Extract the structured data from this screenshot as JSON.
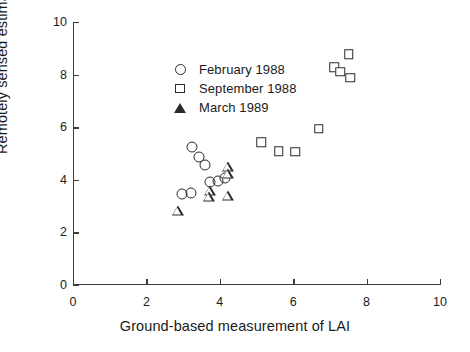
{
  "chart_data": {
    "type": "scatter",
    "title": "",
    "xlabel": "Ground-based measurement of LAI",
    "ylabel": "Remotely sensed estimate of LAI",
    "xlim": [
      0,
      10
    ],
    "ylim": [
      0,
      10
    ],
    "xticks": [
      0,
      2,
      4,
      6,
      8,
      10
    ],
    "yticks": [
      0,
      2,
      4,
      6,
      8,
      10
    ],
    "grid": false,
    "legend_position": "upper-left-inside",
    "series": [
      {
        "name": "February 1988",
        "marker": "circle",
        "points": [
          {
            "x": 3.25,
            "y": 5.25
          },
          {
            "x": 3.42,
            "y": 4.85
          },
          {
            "x": 3.6,
            "y": 4.57
          },
          {
            "x": 2.97,
            "y": 3.45
          },
          {
            "x": 3.22,
            "y": 3.5
          },
          {
            "x": 3.72,
            "y": 3.92
          },
          {
            "x": 3.95,
            "y": 3.95
          },
          {
            "x": 4.15,
            "y": 4.05
          }
        ]
      },
      {
        "name": "September 1988",
        "marker": "square",
        "points": [
          {
            "x": 5.13,
            "y": 5.43
          },
          {
            "x": 5.6,
            "y": 5.08
          },
          {
            "x": 6.05,
            "y": 5.07
          },
          {
            "x": 6.7,
            "y": 5.95
          },
          {
            "x": 7.52,
            "y": 8.78
          },
          {
            "x": 7.12,
            "y": 8.28
          },
          {
            "x": 7.28,
            "y": 8.1
          },
          {
            "x": 7.55,
            "y": 7.88
          }
        ]
      },
      {
        "name": "March 1989",
        "marker": "triangle",
        "points": [
          {
            "x": 2.85,
            "y": 2.8
          },
          {
            "x": 3.72,
            "y": 3.57
          },
          {
            "x": 3.7,
            "y": 3.35
          },
          {
            "x": 4.22,
            "y": 3.37
          },
          {
            "x": 4.22,
            "y": 4.48
          },
          {
            "x": 4.22,
            "y": 4.22
          }
        ]
      }
    ]
  },
  "legend": {
    "items": [
      {
        "label": "February 1988",
        "marker": "circle"
      },
      {
        "label": "September 1988",
        "marker": "square"
      },
      {
        "label": "March 1989",
        "marker": "triangle"
      }
    ]
  },
  "colors": {
    "axis": "#3a3a3a",
    "marker": "#2b2b2b",
    "text": "#1a1a1a",
    "background": "#ffffff"
  }
}
